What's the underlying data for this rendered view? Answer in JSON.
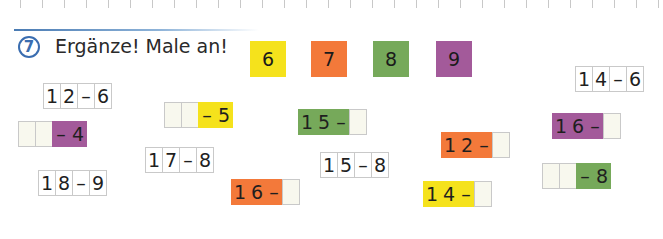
{
  "exercise": {
    "number": "7",
    "instruction": "Ergänze! Male an!"
  },
  "colors": {
    "yellow": "#f5e21c",
    "orange": "#f3793a",
    "green": "#76a95a",
    "purple": "#a35a9a",
    "blank": "#f8f8ee",
    "accent_blue": "#3a6db0"
  },
  "legend": [
    {
      "value": "6",
      "color": "#f5e21c",
      "x": 250,
      "y": 41
    },
    {
      "value": "7",
      "color": "#f3793a",
      "x": 311,
      "y": 41
    },
    {
      "value": "8",
      "color": "#76a95a",
      "x": 373,
      "y": 41
    },
    {
      "value": "9",
      "color": "#a35a9a",
      "x": 436,
      "y": 41
    }
  ],
  "tasks": [
    {
      "id": "12-6",
      "x": 43,
      "y": 83,
      "cells": [
        {
          "t": "1"
        },
        {
          "t": "2"
        },
        {
          "t": "–"
        },
        {
          "t": "6"
        }
      ]
    },
    {
      "id": "__-4",
      "x": 18,
      "y": 121,
      "cells": [
        {
          "t": "",
          "blank": true
        },
        {
          "t": "",
          "blank": true
        },
        {
          "t": "–",
          "c": "#a35a9a"
        },
        {
          "t": "4",
          "c": "#a35a9a"
        }
      ]
    },
    {
      "id": "__-5",
      "x": 164,
      "y": 102,
      "cells": [
        {
          "t": "",
          "blank": true
        },
        {
          "t": "",
          "blank": true
        },
        {
          "t": "–",
          "c": "#f5e21c"
        },
        {
          "t": "5",
          "c": "#f5e21c"
        }
      ]
    },
    {
      "id": "17-8",
      "x": 145,
      "y": 147,
      "cells": [
        {
          "t": "1"
        },
        {
          "t": "7"
        },
        {
          "t": "–"
        },
        {
          "t": "8"
        }
      ]
    },
    {
      "id": "18-9",
      "x": 38,
      "y": 170,
      "cells": [
        {
          "t": "1"
        },
        {
          "t": "8"
        },
        {
          "t": "–"
        },
        {
          "t": "9"
        }
      ]
    },
    {
      "id": "16-_orange",
      "x": 231,
      "y": 179,
      "cells": [
        {
          "t": "1",
          "c": "#f3793a"
        },
        {
          "t": "6",
          "c": "#f3793a"
        },
        {
          "t": "–",
          "c": "#f3793a"
        },
        {
          "t": "",
          "blank": true
        }
      ]
    },
    {
      "id": "15-_green",
      "x": 298,
      "y": 109,
      "cells": [
        {
          "t": "1",
          "c": "#76a95a"
        },
        {
          "t": "5",
          "c": "#76a95a"
        },
        {
          "t": "–",
          "c": "#76a95a"
        },
        {
          "t": "",
          "blank": true
        }
      ]
    },
    {
      "id": "15-8",
      "x": 320,
      "y": 152,
      "cells": [
        {
          "t": "1"
        },
        {
          "t": "5"
        },
        {
          "t": "–"
        },
        {
          "t": "8"
        }
      ]
    },
    {
      "id": "12-_orange",
      "x": 441,
      "y": 132,
      "cells": [
        {
          "t": "1",
          "c": "#f3793a"
        },
        {
          "t": "2",
          "c": "#f3793a"
        },
        {
          "t": "–",
          "c": "#f3793a"
        },
        {
          "t": "",
          "blank": true
        }
      ]
    },
    {
      "id": "14-_yellow",
      "x": 423,
      "y": 181,
      "cells": [
        {
          "t": "1",
          "c": "#f5e21c"
        },
        {
          "t": "4",
          "c": "#f5e21c"
        },
        {
          "t": "–",
          "c": "#f5e21c"
        },
        {
          "t": "",
          "blank": true
        }
      ]
    },
    {
      "id": "14-6",
      "x": 575,
      "y": 66,
      "cells": [
        {
          "t": "1"
        },
        {
          "t": "4"
        },
        {
          "t": "–"
        },
        {
          "t": "6"
        }
      ]
    },
    {
      "id": "16-_purple",
      "x": 552,
      "y": 113,
      "cells": [
        {
          "t": "1",
          "c": "#a35a9a"
        },
        {
          "t": "6",
          "c": "#a35a9a"
        },
        {
          "t": "–",
          "c": "#a35a9a"
        },
        {
          "t": "",
          "blank": true
        }
      ]
    },
    {
      "id": "__-8",
      "x": 542,
      "y": 163,
      "cells": [
        {
          "t": "",
          "blank": true
        },
        {
          "t": "",
          "blank": true
        },
        {
          "t": "–",
          "c": "#76a95a"
        },
        {
          "t": "8",
          "c": "#76a95a"
        }
      ]
    }
  ]
}
